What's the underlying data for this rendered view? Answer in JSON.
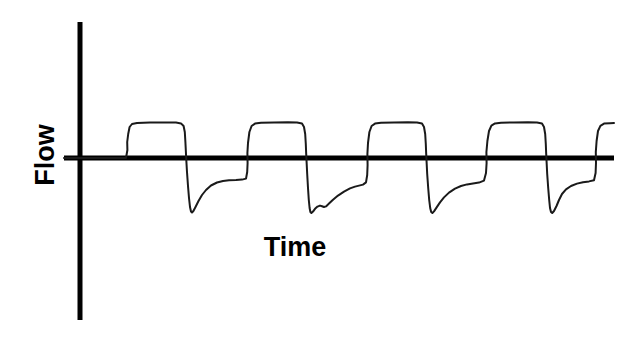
{
  "figure": {
    "title": "",
    "background_color": "#ffffff",
    "line_color": "#1a1a1a",
    "axis_color": "#000000"
  },
  "axes": {
    "ylabel": "Flow",
    "xlabel": "Time",
    "y_axis_x": 80,
    "x_axis_y": 158,
    "x_axis_start": 64,
    "x_axis_end": 614,
    "y_axis_top": 22,
    "y_axis_bottom": 320,
    "axis_width": 5
  },
  "chart_data": {
    "type": "line",
    "title": "",
    "xlabel": "Time",
    "ylabel": "Flow",
    "grid": false,
    "legend": null,
    "xticks": [],
    "yticks": [],
    "xlim": [
      0,
      640
    ],
    "ylim": [
      -1.55,
      1.0
    ],
    "baseline_y": 158,
    "plateau_y": 123,
    "trough_y": 212,
    "cycle_period_px": 120,
    "cycles_shown": 4.5,
    "series": [
      {
        "name": "Flow",
        "stroke_width": 2,
        "points": [
          [
            64,
            158
          ],
          [
            126,
            158
          ],
          [
            127.4,
            150
          ],
          [
            127.2,
            142
          ],
          [
            128.2,
            134
          ],
          [
            129.6,
            127
          ],
          [
            132,
            124
          ],
          [
            137,
            123
          ],
          [
            150,
            122.6
          ],
          [
            165,
            122.4
          ],
          [
            176,
            122.6
          ],
          [
            181,
            123.4
          ],
          [
            183.6,
            126
          ],
          [
            184.8,
            132
          ],
          [
            185.4,
            142
          ],
          [
            185.9,
            152
          ],
          [
            186.3,
            160
          ],
          [
            187,
            172
          ],
          [
            188,
            186
          ],
          [
            189,
            198
          ],
          [
            190,
            207
          ],
          [
            191,
            211.5
          ],
          [
            192,
            212.5
          ],
          [
            193.4,
            211
          ],
          [
            195.5,
            207
          ],
          [
            198.5,
            201
          ],
          [
            202,
            195
          ],
          [
            206,
            190
          ],
          [
            211,
            185.5
          ],
          [
            217,
            182.5
          ],
          [
            223,
            181
          ],
          [
            229,
            180.3
          ],
          [
            236,
            180
          ],
          [
            242,
            179.6
          ],
          [
            246,
            178.6
          ],
          [
            247.2,
            172
          ],
          [
            247.6,
            163
          ],
          [
            247.4,
            153
          ],
          [
            248,
            143
          ],
          [
            249.4,
            132
          ],
          [
            251.6,
            126
          ],
          [
            255,
            123.6
          ],
          [
            261,
            122.8
          ],
          [
            274,
            122.4
          ],
          [
            288,
            122.3
          ],
          [
            297,
            122.6
          ],
          [
            302,
            123.6
          ],
          [
            304,
            127
          ],
          [
            305.2,
            134
          ],
          [
            305.8,
            144
          ],
          [
            306.2,
            154
          ],
          [
            306.6,
            162
          ],
          [
            307.2,
            174
          ],
          [
            308,
            188
          ],
          [
            308.8,
            200
          ],
          [
            309.6,
            208
          ],
          [
            310.4,
            212
          ],
          [
            311.4,
            213
          ],
          [
            313,
            211.6
          ],
          [
            315,
            208.8
          ],
          [
            317.5,
            206.6
          ],
          [
            320,
            205.6
          ],
          [
            322,
            206.2
          ],
          [
            324,
            207
          ],
          [
            326,
            206.4
          ],
          [
            329,
            203.6
          ],
          [
            333,
            199.8
          ],
          [
            338,
            195.6
          ],
          [
            344,
            191.6
          ],
          [
            350,
            188.4
          ],
          [
            355,
            186.6
          ],
          [
            359,
            185.6
          ],
          [
            363,
            184.6
          ],
          [
            366,
            182.4
          ],
          [
            367.2,
            175
          ],
          [
            367.6,
            165
          ],
          [
            367.4,
            154
          ],
          [
            368,
            143
          ],
          [
            369.4,
            132
          ],
          [
            371.6,
            126
          ],
          [
            375,
            123.6
          ],
          [
            381,
            122.8
          ],
          [
            394,
            122.4
          ],
          [
            408,
            122.3
          ],
          [
            417,
            122.6
          ],
          [
            422,
            123.6
          ],
          [
            424,
            127
          ],
          [
            425.2,
            134
          ],
          [
            425.8,
            144
          ],
          [
            426.2,
            154
          ],
          [
            426.6,
            162
          ],
          [
            427.2,
            174
          ],
          [
            428.2,
            188
          ],
          [
            429.2,
            200
          ],
          [
            430.2,
            208
          ],
          [
            431.2,
            212
          ],
          [
            432.4,
            213
          ],
          [
            434,
            211.4
          ],
          [
            436.5,
            207.6
          ],
          [
            440,
            202.4
          ],
          [
            444,
            197.4
          ],
          [
            449,
            192.6
          ],
          [
            455,
            188.6
          ],
          [
            461,
            186
          ],
          [
            467,
            184.4
          ],
          [
            473,
            183.4
          ],
          [
            479,
            182.6
          ],
          [
            484,
            180.6
          ],
          [
            486,
            173
          ],
          [
            486.6,
            163
          ],
          [
            486.4,
            152
          ],
          [
            487.4,
            141
          ],
          [
            489,
            131
          ],
          [
            491.4,
            125.6
          ],
          [
            495,
            123.4
          ],
          [
            501,
            122.7
          ],
          [
            514,
            122.4
          ],
          [
            528,
            122.3
          ],
          [
            537,
            122.6
          ],
          [
            542,
            123.6
          ],
          [
            544,
            127
          ],
          [
            545.2,
            134
          ],
          [
            545.8,
            144
          ],
          [
            546.2,
            154
          ],
          [
            546.6,
            162
          ],
          [
            547.2,
            174
          ],
          [
            548.2,
            188
          ],
          [
            549.2,
            200
          ],
          [
            550,
            208
          ],
          [
            551,
            212
          ],
          [
            552.2,
            213
          ],
          [
            554,
            211
          ],
          [
            556.5,
            206
          ],
          [
            559,
            200
          ],
          [
            562,
            194
          ],
          [
            566,
            189.4
          ],
          [
            571,
            186
          ],
          [
            577,
            183.6
          ],
          [
            583,
            182.2
          ],
          [
            589,
            181.4
          ],
          [
            594,
            180.2
          ],
          [
            595.6,
            173
          ],
          [
            596,
            163
          ],
          [
            595.8,
            152
          ],
          [
            596.6,
            141
          ],
          [
            598,
            131
          ],
          [
            600.4,
            125.8
          ],
          [
            604,
            123.6
          ],
          [
            610,
            123.2
          ],
          [
            614,
            123.1
          ]
        ]
      }
    ]
  }
}
